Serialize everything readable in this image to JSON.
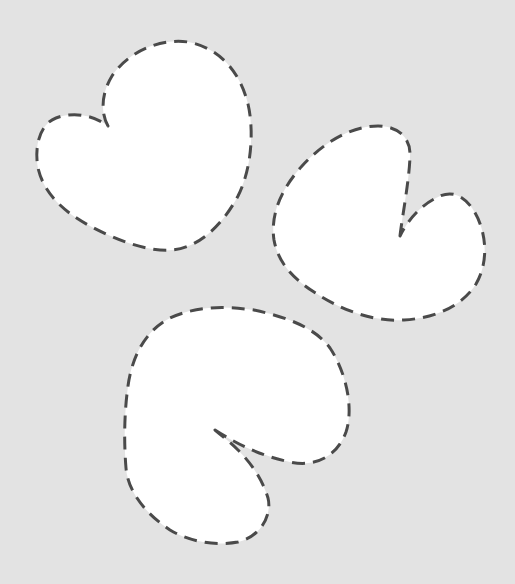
{
  "canvas": {
    "width": 515,
    "height": 584,
    "background": "#e3e3e3"
  },
  "style": {
    "shape_fill": "#ffffff",
    "outline_color": "#4a4a4a",
    "outline_style": "dashed"
  },
  "shapes": [
    {
      "name": "shape-top-left",
      "path": "M 108 126 C 100 112 102 92 112 76 C 128 52 160 38 188 42 C 220 48 240 72 248 104 C 254 130 252 168 238 196 C 222 226 198 248 172 250 C 148 252 116 240 90 226 C 64 212 44 194 38 168 C 34 146 40 124 56 118 C 72 112 92 114 108 126 Z"
    },
    {
      "name": "shape-right",
      "path": "M 400 236 C 402 218 410 176 410 154 C 410 136 396 126 378 126 C 350 126 322 144 302 166 C 282 188 270 214 274 240 C 278 262 292 278 314 292 C 338 308 370 322 404 320 C 436 318 462 306 476 284 C 490 260 486 228 472 208 C 462 194 450 190 436 198 C 420 206 408 220 400 236 Z"
    },
    {
      "name": "shape-bottom",
      "path": "M 215 430 C 240 446 262 456 290 462 C 318 468 338 454 346 432 C 354 408 346 372 330 348 C 314 326 282 316 254 310 C 224 306 196 306 170 318 C 146 330 132 356 128 386 C 124 414 124 444 126 468 C 128 492 146 514 170 530 C 190 542 216 546 238 542 C 262 536 272 514 268 498 C 262 478 250 462 238 450 C 230 442 222 436 215 430 Z"
    }
  ]
}
